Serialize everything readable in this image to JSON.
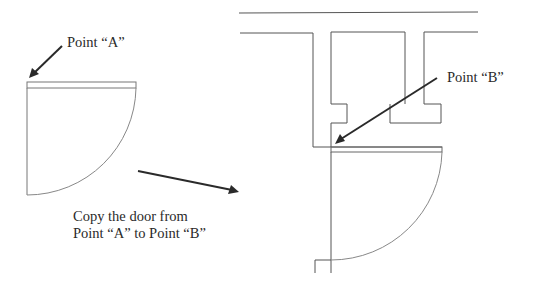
{
  "labels": {
    "point_a": "Point “A”",
    "point_b": "Point “B”",
    "instruction_line1": "Copy the door from",
    "instruction_line2": "Point “A” to Point “B”"
  },
  "colors": {
    "wall_line": "#555555",
    "door_arc": "#888888",
    "arrow": "#2a2a2a",
    "text": "#2a2a2a",
    "background": "#ffffff"
  },
  "elements": {
    "source_door": {
      "description": "Door swing symbol at Point A"
    },
    "target_wall": {
      "description": "Floor plan wall opening at Point B"
    },
    "copied_door": {
      "description": "Door swing symbol placed at Point B"
    },
    "direction_arrow": {
      "description": "Arrow indicating copy direction"
    }
  }
}
